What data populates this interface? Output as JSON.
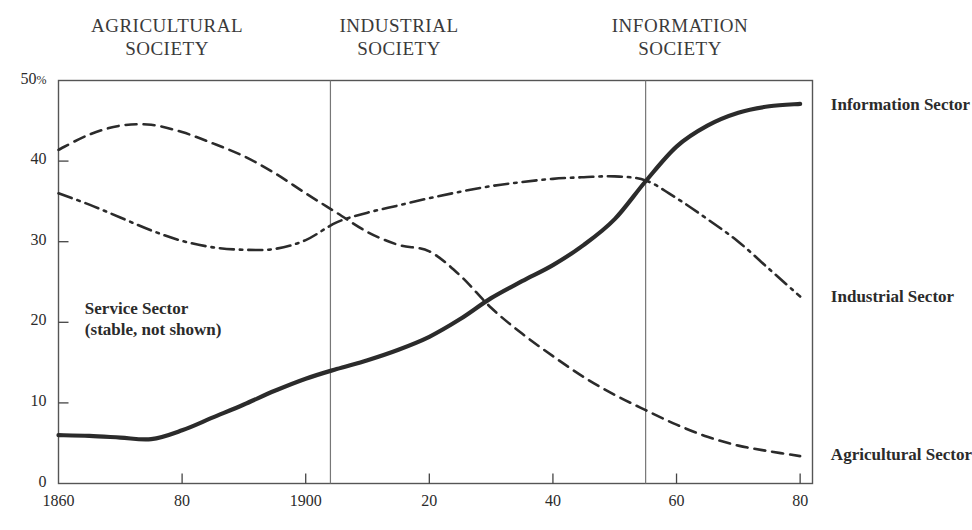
{
  "chart_data": {
    "type": "line",
    "title": "",
    "xlabel": "",
    "ylabel": "",
    "xlim": [
      1860,
      1982
    ],
    "ylim": [
      0,
      50
    ],
    "grid": false,
    "legend_position": "right-inline",
    "y_unit": "%",
    "y_ticks": [
      {
        "value": 50,
        "label": "50"
      },
      {
        "value": 40,
        "label": "40"
      },
      {
        "value": 30,
        "label": "30"
      },
      {
        "value": 20,
        "label": "20"
      },
      {
        "value": 10,
        "label": "10"
      },
      {
        "value": 0,
        "label": "0"
      }
    ],
    "x_ticks": [
      {
        "value": 1860,
        "label": "1860"
      },
      {
        "value": 1880,
        "label": "80"
      },
      {
        "value": 1900,
        "label": "1900"
      },
      {
        "value": 1920,
        "label": "20"
      },
      {
        "value": 1940,
        "label": "40"
      },
      {
        "value": 1960,
        "label": "60"
      },
      {
        "value": 1980,
        "label": "80"
      }
    ],
    "eras": [
      {
        "name": "AGRICULTURAL\nSOCIETY",
        "start": 1860,
        "end": 1904
      },
      {
        "name": "INDUSTRIAL\nSOCIETY",
        "start": 1904,
        "end": 1955
      },
      {
        "name": "INFORMATION\nSOCIETY",
        "start": 1955,
        "end": 1982
      }
    ],
    "era_dividers": [
      1904,
      1955
    ],
    "annotations": [
      {
        "text": "Service Sector\n(stable, not shown)",
        "x": 1862,
        "y": 21.5
      }
    ],
    "series": [
      {
        "name": "Information Sector",
        "style": "solid",
        "color": "#2b2b2b",
        "label_x": 1984,
        "label_y": 46.8,
        "x": [
          1860,
          1865,
          1870,
          1875,
          1880,
          1885,
          1890,
          1895,
          1900,
          1905,
          1910,
          1915,
          1920,
          1925,
          1930,
          1935,
          1940,
          1945,
          1950,
          1955,
          1960,
          1965,
          1970,
          1975,
          1980
        ],
        "y": [
          6.0,
          5.9,
          5.7,
          5.5,
          6.6,
          8.2,
          9.8,
          11.5,
          13.0,
          14.2,
          15.3,
          16.6,
          18.2,
          20.4,
          23.0,
          25.1,
          27.1,
          29.6,
          32.8,
          37.5,
          41.8,
          44.4,
          46.0,
          46.8,
          47.1
        ]
      },
      {
        "name": "Industrial Sector",
        "style": "dashdot",
        "color": "#2b2b2b",
        "label_x": 1984,
        "label_y": 23.0,
        "x": [
          1860,
          1865,
          1870,
          1875,
          1880,
          1885,
          1890,
          1895,
          1900,
          1905,
          1910,
          1915,
          1920,
          1925,
          1930,
          1935,
          1940,
          1945,
          1950,
          1955,
          1960,
          1965,
          1970,
          1975,
          1980
        ],
        "y": [
          36.0,
          34.6,
          33.0,
          31.4,
          30.1,
          29.3,
          29.0,
          29.1,
          30.2,
          32.4,
          33.6,
          34.5,
          35.4,
          36.2,
          36.9,
          37.4,
          37.8,
          38.0,
          38.1,
          37.6,
          35.4,
          32.8,
          30.0,
          26.6,
          23.2
        ]
      },
      {
        "name": "Agricultural Sector",
        "style": "dashed",
        "color": "#2b2b2b",
        "label_x": 1984,
        "label_y": 3.4,
        "x": [
          1860,
          1865,
          1870,
          1875,
          1880,
          1885,
          1890,
          1895,
          1900,
          1905,
          1910,
          1915,
          1920,
          1925,
          1930,
          1935,
          1940,
          1945,
          1950,
          1955,
          1960,
          1965,
          1970,
          1975,
          1980
        ],
        "y": [
          41.4,
          43.3,
          44.4,
          44.5,
          43.6,
          42.2,
          40.6,
          38.5,
          36.0,
          33.6,
          31.2,
          29.6,
          28.8,
          25.8,
          21.8,
          18.6,
          15.8,
          13.2,
          11.0,
          9.1,
          7.3,
          5.8,
          4.7,
          4.0,
          3.4
        ]
      }
    ]
  }
}
